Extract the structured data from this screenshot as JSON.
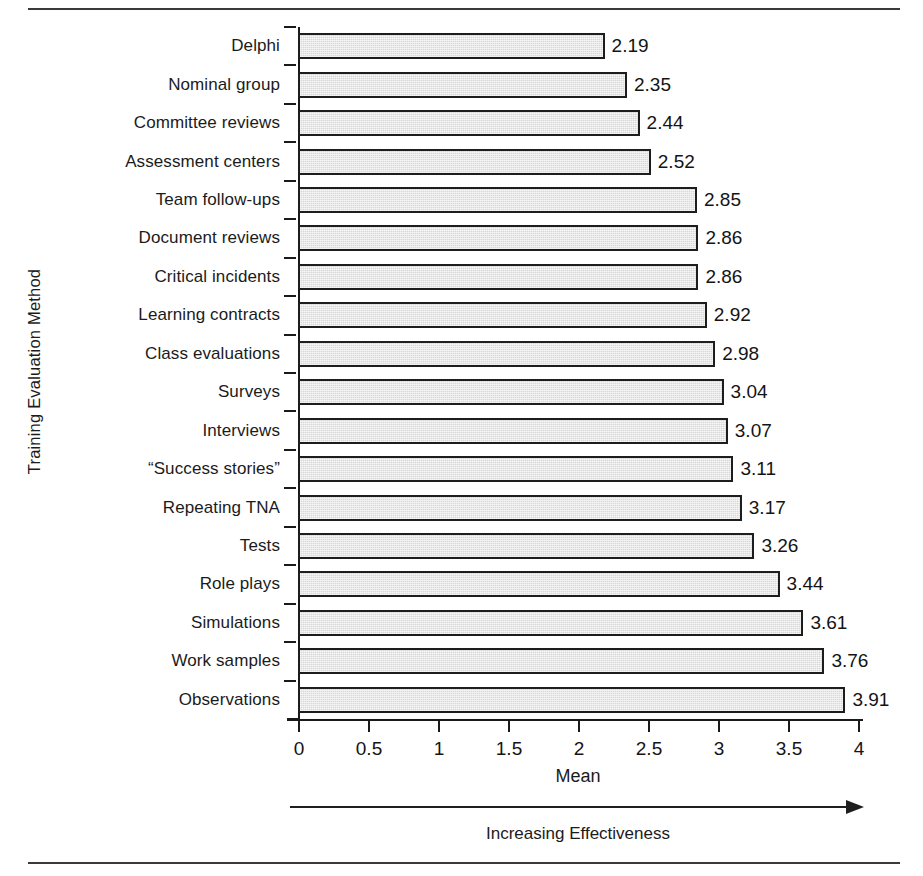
{
  "figure": {
    "y_axis_title": "Training Evaluation Method",
    "x_axis_title": "Mean",
    "effectiveness_caption": "Increasing Effectiveness",
    "arrow_icon": "right-arrow-icon"
  },
  "chart_data": {
    "type": "bar",
    "orientation": "horizontal",
    "title": "",
    "xlabel": "Mean",
    "ylabel": "Training Evaluation Method",
    "xlim": [
      0,
      4
    ],
    "xticks": [
      "0",
      "0.5",
      "1",
      "1.5",
      "2",
      "2.5",
      "3",
      "3.5",
      "4"
    ],
    "xtick_values": [
      0,
      0.5,
      1,
      1.5,
      2,
      2.5,
      3,
      3.5,
      4
    ],
    "grid": false,
    "legend": null,
    "annotation": "Increasing Effectiveness",
    "bar_fill": "#d8d8d8",
    "bar_edge": "#1d1d1d",
    "categories": [
      "Delphi",
      "Nominal group",
      "Committee reviews",
      "Assessment centers",
      "Team follow-ups",
      "Document reviews",
      "Critical incidents",
      "Learning contracts",
      "Class evaluations",
      "Surveys",
      "Interviews",
      "“Success stories”",
      "Repeating TNA",
      "Tests",
      "Role plays",
      "Simulations",
      "Work samples",
      "Observations"
    ],
    "values": [
      2.19,
      2.35,
      2.44,
      2.52,
      2.85,
      2.86,
      2.86,
      2.92,
      2.98,
      3.04,
      3.07,
      3.11,
      3.17,
      3.26,
      3.44,
      3.61,
      3.76,
      3.91
    ],
    "value_labels": [
      "2.19",
      "2.35",
      "2.44",
      "2.52",
      "2.85",
      "2.86",
      "2.86",
      "2.92",
      "2.98",
      "3.04",
      "3.07",
      "3.11",
      "3.17",
      "3.26",
      "3.44",
      "3.61",
      "3.76",
      "3.91"
    ]
  }
}
